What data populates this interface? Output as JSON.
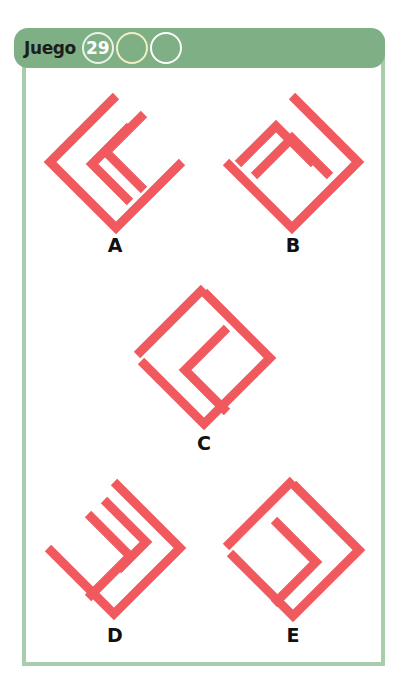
{
  "header": {
    "label": "Juego",
    "number": "29",
    "circles": [
      {
        "name": "game-number-circle",
        "value": "29",
        "style": "filled-number"
      },
      {
        "name": "progress-circle-2",
        "value": "",
        "style": "cream"
      },
      {
        "name": "progress-circle-3",
        "value": "",
        "style": "white"
      }
    ],
    "bar_color": "#7fb085",
    "frame_color": "#a8cdab"
  },
  "colors": {
    "shape_stroke": "#f05a5e",
    "label_text": "#111111",
    "page_background": "#ffffff"
  },
  "puzzle": {
    "options": [
      {
        "label": "A",
        "description": "open diamond chevron pointing right with two nested chevrons pointing left",
        "outer": "chevron-open-right",
        "inner_count": 2,
        "inner_direction": "left"
      },
      {
        "label": "B",
        "description": "open diamond chevron pointing left with two nested chevrons pointing up",
        "outer": "chevron-open-left",
        "inner_count": 2,
        "inner_direction": "up"
      },
      {
        "label": "C",
        "description": "closed diamond outline with one chevron pointing left",
        "outer": "diamond-closed",
        "inner_count": 1,
        "inner_direction": "left"
      },
      {
        "label": "D",
        "description": "open diamond chevron pointing left with two nested chevrons pointing right",
        "outer": "chevron-open-left",
        "inner_count": 2,
        "inner_direction": "right"
      },
      {
        "label": "E",
        "description": "closed diamond outline with one chevron pointing right",
        "outer": "diamond-closed",
        "inner_count": 1,
        "inner_direction": "right"
      }
    ]
  }
}
